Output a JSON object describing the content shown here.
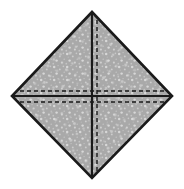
{
  "figure": {
    "title": "Folded square diagram",
    "canvas": {
      "width": 184,
      "height": 189,
      "background_color": "#ffffff"
    },
    "shape": {
      "name": "diamond",
      "type": "rotated-square",
      "fill_color": "#a9a9a9",
      "stroke_color": "#1a1a1a",
      "stroke_width": 2.6,
      "texture": "light-speckled-noise",
      "texture_color": "#d8d8d8",
      "vertices": {
        "top": {
          "x": 92,
          "y": 12
        },
        "right": {
          "x": 172,
          "y": 96
        },
        "bottom": {
          "x": 92,
          "y": 178
        },
        "left": {
          "x": 12,
          "y": 96
        }
      },
      "center": {
        "x": 92,
        "y": 96
      }
    },
    "solid_lines": [
      {
        "name": "vertical-median",
        "orientation": "vertical",
        "color": "#1a1a1a",
        "width": 2.2,
        "from": {
          "x": 92,
          "y": 12
        },
        "to": {
          "x": 92,
          "y": 178
        }
      },
      {
        "name": "horizontal-median",
        "orientation": "horizontal",
        "color": "#1a1a1a",
        "width": 2.2,
        "from": {
          "x": 12,
          "y": 96
        },
        "to": {
          "x": 172,
          "y": 96
        }
      }
    ],
    "dashed_lines": [
      {
        "name": "vertical-fold-line",
        "orientation": "vertical",
        "color": "#1a1a1a",
        "width": 1.4,
        "dash_pattern": "4 3",
        "offset_from_median_px": 5,
        "from": {
          "x": 97,
          "y": 17
        },
        "to": {
          "x": 97,
          "y": 173
        }
      },
      {
        "name": "horizontal-fold-line-upper",
        "orientation": "horizontal",
        "color": "#1a1a1a",
        "width": 1.4,
        "dash_pattern": "4 3",
        "offset_from_median_px": -5,
        "from": {
          "x": 17,
          "y": 91
        },
        "to": {
          "x": 167,
          "y": 91
        }
      },
      {
        "name": "horizontal-fold-line-lower",
        "orientation": "horizontal",
        "color": "#1a1a1a",
        "width": 1.4,
        "dash_pattern": "4 3",
        "offset_from_median_px": 6,
        "from": {
          "x": 18,
          "y": 102
        },
        "to": {
          "x": 166,
          "y": 102
        }
      }
    ],
    "quadrants": [
      {
        "name": "top-left-quadrant"
      },
      {
        "name": "top-right-quadrant"
      },
      {
        "name": "bottom-left-quadrant"
      },
      {
        "name": "bottom-right-quadrant"
      }
    ]
  }
}
